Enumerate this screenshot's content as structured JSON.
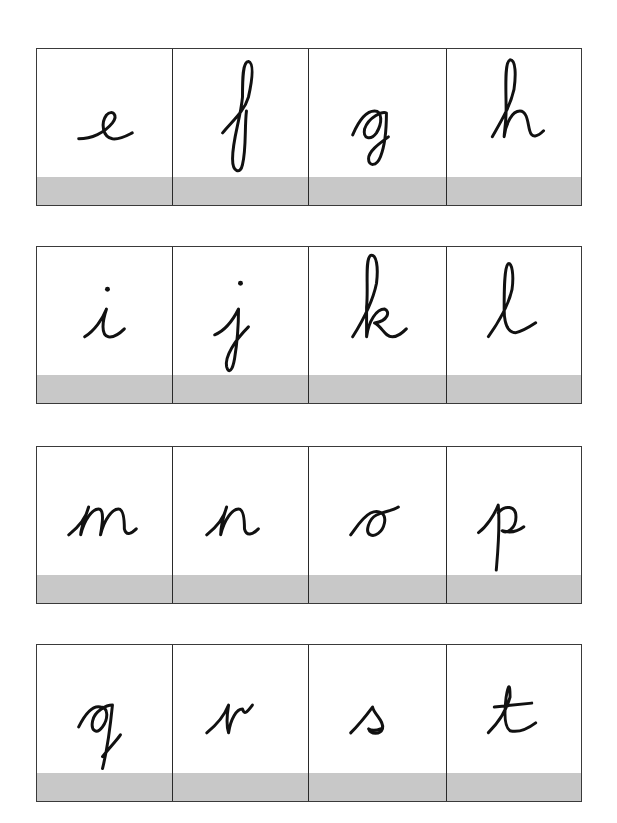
{
  "worksheet": {
    "strip_color": "#c8c8c8",
    "rows": [
      {
        "cards": [
          {
            "letter": "e"
          },
          {
            "letter": "f"
          },
          {
            "letter": "g"
          },
          {
            "letter": "h"
          }
        ]
      },
      {
        "cards": [
          {
            "letter": "i"
          },
          {
            "letter": "j"
          },
          {
            "letter": "k"
          },
          {
            "letter": "l"
          }
        ]
      },
      {
        "cards": [
          {
            "letter": "m"
          },
          {
            "letter": "n"
          },
          {
            "letter": "o"
          },
          {
            "letter": "p"
          }
        ]
      },
      {
        "cards": [
          {
            "letter": "q"
          },
          {
            "letter": "r"
          },
          {
            "letter": "s"
          },
          {
            "letter": "t"
          }
        ]
      }
    ]
  }
}
